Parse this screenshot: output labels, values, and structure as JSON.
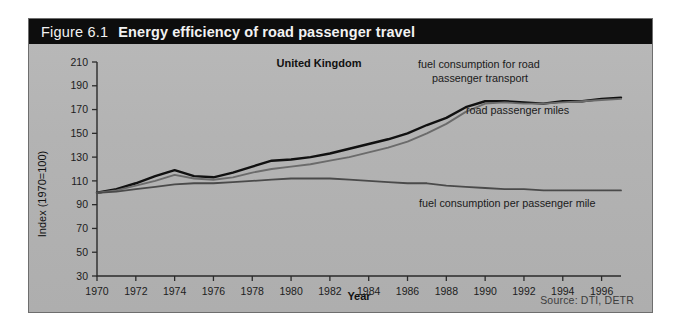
{
  "figure": {
    "number": "Figure 6.1",
    "title": "Energy efficiency of road passenger travel",
    "region": "United Kingdom",
    "source": "Source: DTI, DETR"
  },
  "annotations": {
    "fuel_transport": "fuel consumption for road",
    "fuel_transport_2": "passenger transport",
    "passenger_miles": "road passenger miles",
    "fuel_per_mile": "fuel consumption per passenger mile"
  },
  "chart_data": {
    "type": "line",
    "title": "Energy efficiency of road passenger travel",
    "subtitle": "United Kingdom",
    "xlabel": "Year",
    "ylabel": "Index (1970=100)",
    "xlim": [
      1970,
      1997
    ],
    "ylim": [
      30,
      210
    ],
    "ytick_step": 20,
    "yticks": [
      30,
      50,
      70,
      90,
      110,
      130,
      150,
      170,
      190,
      210
    ],
    "xticks": [
      1970,
      1972,
      1974,
      1976,
      1978,
      1980,
      1982,
      1984,
      1986,
      1988,
      1990,
      1992,
      1994,
      1996
    ],
    "x": [
      1970,
      1971,
      1972,
      1973,
      1974,
      1975,
      1976,
      1977,
      1978,
      1979,
      1980,
      1981,
      1982,
      1983,
      1984,
      1985,
      1986,
      1987,
      1988,
      1989,
      1990,
      1991,
      1992,
      1993,
      1994,
      1995,
      1996,
      1997
    ],
    "grid": false,
    "legend": "annotated-inline",
    "series": [
      {
        "name": "fuel consumption for road passenger transport",
        "color": "#111111",
        "values": [
          100,
          103,
          108,
          114,
          119,
          114,
          113,
          117,
          122,
          127,
          128,
          130,
          133,
          137,
          141,
          145,
          150,
          157,
          163,
          172,
          177,
          177,
          176,
          175,
          177,
          177,
          179,
          180
        ]
      },
      {
        "name": "road passenger miles",
        "color": "#6b6b6b",
        "values": [
          100,
          102,
          106,
          110,
          115,
          112,
          111,
          113,
          117,
          120,
          122,
          124,
          127,
          130,
          134,
          138,
          143,
          150,
          158,
          168,
          175,
          176,
          175,
          175,
          176,
          177,
          178,
          179
        ]
      },
      {
        "name": "fuel consumption per passenger mile",
        "color": "#4a4a4a",
        "values": [
          100,
          101,
          103,
          105,
          107,
          108,
          108,
          109,
          110,
          111,
          112,
          112,
          112,
          111,
          110,
          109,
          108,
          108,
          106,
          105,
          104,
          103,
          103,
          102,
          102,
          102,
          102,
          102
        ]
      }
    ]
  }
}
